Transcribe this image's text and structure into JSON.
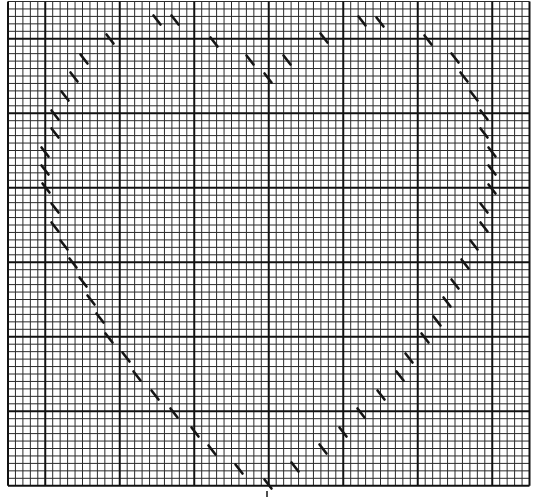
{
  "pattern": {
    "type": "cross-stitch-chart",
    "shape": "heart-outline",
    "grid": {
      "origin_x": 8,
      "origin_y": 1.5,
      "cell": 7.45,
      "cols": 70,
      "rows": 65,
      "major_every": 10,
      "major_col_offset": 5,
      "major_row_offset": 5,
      "minor_color": "#2a2a2a",
      "major_color": "#111111",
      "minor_width": 1,
      "major_width": 2
    },
    "stitch_color": "#151515",
    "stitches": [
      [
        157,
        20
      ],
      [
        175,
        20
      ],
      [
        110,
        39
      ],
      [
        214,
        42
      ],
      [
        84,
        59
      ],
      [
        250,
        60
      ],
      [
        287,
        60
      ],
      [
        74,
        77
      ],
      [
        268,
        78
      ],
      [
        65,
        96
      ],
      [
        324,
        38
      ],
      [
        362,
        21
      ],
      [
        380,
        22
      ],
      [
        428,
        40
      ],
      [
        455,
        58
      ],
      [
        464,
        77
      ],
      [
        474,
        96
      ],
      [
        484,
        115
      ],
      [
        484,
        133
      ],
      [
        492,
        152
      ],
      [
        492,
        170
      ],
      [
        492,
        189
      ],
      [
        484,
        208
      ],
      [
        484,
        227
      ],
      [
        474,
        245
      ],
      [
        465,
        264
      ],
      [
        455,
        284
      ],
      [
        447,
        302
      ],
      [
        437,
        321
      ],
      [
        425,
        338
      ],
      [
        409,
        358
      ],
      [
        400,
        376
      ],
      [
        381,
        395
      ],
      [
        361,
        413
      ],
      [
        343,
        432
      ],
      [
        55,
        115
      ],
      [
        55,
        133
      ],
      [
        45,
        152
      ],
      [
        45,
        170
      ],
      [
        46,
        188
      ],
      [
        55,
        208
      ],
      [
        55,
        227
      ],
      [
        64,
        245
      ],
      [
        73,
        263
      ],
      [
        83,
        282
      ],
      [
        91,
        300
      ],
      [
        100,
        318
      ],
      [
        109,
        338
      ],
      [
        126,
        357
      ],
      [
        137,
        376
      ],
      [
        155,
        395
      ],
      [
        174,
        413
      ],
      [
        195,
        432
      ],
      [
        212,
        450
      ],
      [
        239,
        469
      ],
      [
        268,
        484
      ],
      [
        295,
        467
      ],
      [
        323,
        449
      ]
    ],
    "center_marker": [
      267,
      494
    ]
  }
}
